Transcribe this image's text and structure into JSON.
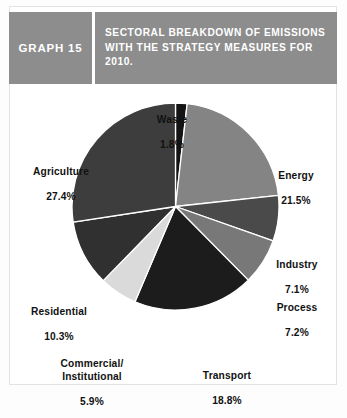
{
  "header": {
    "graph_number": "GRAPH 15",
    "title": "SECTORAL BREAKDOWN OF EMISSIONS WITH THE STRATEGY MEASURES FOR 2010.",
    "band_color": "#8d8d8d",
    "text_color": "#ffffff"
  },
  "labels": {
    "waste_name": "Waste",
    "waste_value": "1.8%",
    "energy_name": "Energy",
    "energy_value": "21.5%",
    "industry_name": "Industry",
    "industry_value": "7.1%",
    "process_name": "Process",
    "process_value": "7.2%",
    "transport_name": "Transport",
    "transport_value": "18.8%",
    "commercial_name": "Commercial/\nInstitutional",
    "commercial_value": "5.9%",
    "residential_name": "Residential",
    "residential_value": "10.3%",
    "agriculture_name": "Agriculture",
    "agriculture_value": "27.4%"
  },
  "chart_data": {
    "type": "pie",
    "title": "SECTORAL BREAKDOWN OF EMISSIONS WITH THE STRATEGY MEASURES FOR 2010.",
    "xlabel": "",
    "ylabel": "",
    "unit": "percent",
    "total": 100.0,
    "start_angle_deg": 0,
    "direction": "clockwise",
    "legend": "none",
    "grid": false,
    "categories": [
      "Waste",
      "Energy",
      "Industry",
      "Process",
      "Transport",
      "Commercial/Institutional",
      "Residential",
      "Agriculture"
    ],
    "values": [
      1.8,
      21.5,
      7.1,
      7.2,
      18.8,
      5.9,
      10.3,
      27.4
    ],
    "slices": [
      {
        "label": "Waste",
        "value": 1.8,
        "display": "1.8%",
        "color": "#141414"
      },
      {
        "label": "Energy",
        "value": 21.5,
        "display": "21.5%",
        "color": "#848484"
      },
      {
        "label": "Industry",
        "value": 7.1,
        "display": "7.1%",
        "color": "#4a4a4a"
      },
      {
        "label": "Process",
        "value": 7.2,
        "display": "7.2%",
        "color": "#787878"
      },
      {
        "label": "Transport",
        "value": 18.8,
        "display": "18.8%",
        "color": "#1c1c1c"
      },
      {
        "label": "Commercial/Institutional",
        "value": 5.9,
        "display": "5.9%",
        "color": "#dadada"
      },
      {
        "label": "Residential",
        "value": 10.3,
        "display": "10.3%",
        "color": "#303030"
      },
      {
        "label": "Agriculture",
        "value": 27.4,
        "display": "27.4%",
        "color": "#3d3d3d"
      }
    ],
    "slice_separator_color": "#ffffff"
  }
}
